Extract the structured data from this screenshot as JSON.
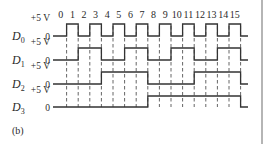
{
  "figure": {
    "label": "(b)",
    "time_labels": [
      "0",
      "1",
      "2",
      "3",
      "4",
      "5",
      "6",
      "7",
      "8",
      "9",
      "10",
      "11",
      "12",
      "13",
      "14",
      "15"
    ],
    "high_level_label": "+5 V",
    "low_level_label": "0",
    "signals": [
      {
        "name": "D",
        "subscript": "0",
        "levels": [
          0,
          1,
          0,
          1,
          0,
          1,
          0,
          1,
          0,
          1,
          0,
          1,
          0,
          1,
          0,
          1
        ]
      },
      {
        "name": "D",
        "subscript": "1",
        "levels": [
          0,
          0,
          1,
          1,
          0,
          0,
          1,
          1,
          0,
          0,
          1,
          1,
          0,
          0,
          1,
          1
        ]
      },
      {
        "name": "D",
        "subscript": "2",
        "levels": [
          0,
          0,
          0,
          0,
          1,
          1,
          1,
          1,
          0,
          0,
          0,
          0,
          1,
          1,
          1,
          1
        ]
      },
      {
        "name": "D",
        "subscript": "3",
        "levels": [
          0,
          0,
          0,
          0,
          0,
          0,
          0,
          0,
          1,
          1,
          1,
          1,
          1,
          1,
          1,
          1
        ]
      }
    ],
    "colors": {
      "line": "#333333",
      "text": "#2a2a2a",
      "border": "#b5b5b5"
    }
  }
}
